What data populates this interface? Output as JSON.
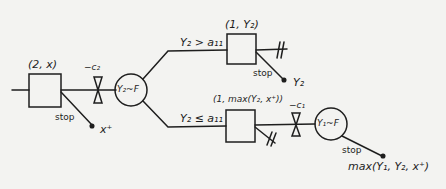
{
  "diagram": {
    "type": "decision-tree",
    "nodes": {
      "decision1": {
        "label": "(2, x)",
        "stop_label": "stop",
        "stop_payoff": "x⁺"
      },
      "cost2": {
        "label": "−c₂"
      },
      "chance2": {
        "label": "Y₂~F"
      },
      "upper_branch": {
        "condition": "Y₂ > a₁₁"
      },
      "decision_upper": {
        "label": "(1, Y₂)",
        "stop_label": "stop",
        "stop_payoff": "Y₂"
      },
      "lower_branch": {
        "condition": "Y₂ ≤ a₁₁"
      },
      "decision_lower": {
        "label": "(1, max(Y₂, x⁺))"
      },
      "cost1": {
        "label": "−c₁"
      },
      "chance1": {
        "label": "Y₁~F",
        "stop_label": "stop",
        "stop_payoff": "max(Y₁, Y₂, x⁺)"
      }
    },
    "stroke_color": "#1e1e1e",
    "background_color": "#f3f3f1"
  }
}
